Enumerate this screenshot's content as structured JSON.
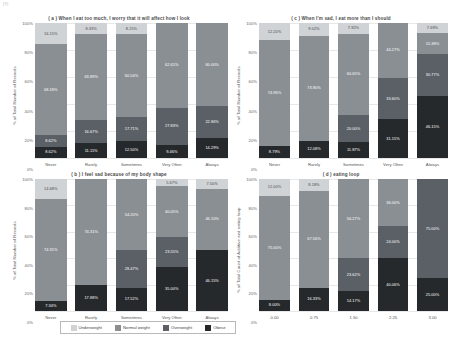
{
  "corner_mark": "[9]",
  "legend": {
    "items": [
      {
        "label": "Underweight",
        "color": "#cfd3d6"
      },
      {
        "label": "Normal weight",
        "color": "#8a8f94"
      },
      {
        "label": "Overweight",
        "color": "#5a6066"
      },
      {
        "label": "Obese",
        "color": "#26292c"
      }
    ]
  },
  "yticks": [
    "100%",
    "80%",
    "60%",
    "40%",
    "20%",
    "0%"
  ],
  "chart_data": [
    {
      "id": "a",
      "type": "bar",
      "stacked": true,
      "title": "( a ) When I eat too much, I worry that it will affect how I look",
      "xlabel": "",
      "ylabel": "% of Total Number of Records",
      "ylim": [
        0,
        100
      ],
      "grid": true,
      "legend_position": "bottom-center",
      "categories": [
        "Never",
        "Rarely",
        "Sometimes",
        "Very Often",
        "Always"
      ],
      "series": [
        {
          "name": "Underweight",
          "values": [
            16.15,
            8.33,
            8.25,
            0.0,
            0.0
          ],
          "labels": [
            "16.15%",
            "8.33%",
            "8.25%",
            "",
            ""
          ]
        },
        {
          "name": "Normal weight",
          "values": [
            68.18,
            63.89,
            60.54,
            62.61,
            60.0
          ],
          "labels": [
            "68.18%",
            "63.89%",
            "60.54%",
            "62.61%",
            "60.00%"
          ]
        },
        {
          "name": "Overweight",
          "values": [
            8.62,
            16.67,
            17.71,
            27.83,
            22.86
          ],
          "labels": [
            "8.62%",
            "16.67%",
            "17.71%",
            "27.83%",
            "22.86%"
          ]
        },
        {
          "name": "Obese",
          "values": [
            8.62,
            11.11,
            12.5,
            9.46,
            14.29
          ],
          "labels": [
            "8.62%",
            "11.11%",
            "12.50%",
            "9.46%",
            "14.29%"
          ]
        }
      ]
    },
    {
      "id": "c",
      "type": "bar",
      "stacked": true,
      "title": "( c ) When I'm sad, I eat more than I should",
      "xlabel": "",
      "ylabel": "% of Total Number of Records",
      "ylim": [
        0,
        100
      ],
      "grid": true,
      "categories": [
        "Never",
        "Rarely",
        "Sometimes",
        "Very Often",
        "Always"
      ],
      "series": [
        {
          "name": "Underweight",
          "values": [
            12.2,
            9.02,
            7.92,
            0.0,
            7.69
          ],
          "labels": [
            "12.20%",
            "9.02%",
            "7.92%",
            "",
            "7.69%"
          ]
        },
        {
          "name": "Normal weight",
          "values": [
            74.96,
            73.9,
            60.65,
            44.27,
            15.38
          ],
          "labels": [
            "74.96%",
            "73.90%",
            "60.65%",
            "44.27%",
            "15.38%"
          ]
        },
        {
          "name": "Overweight",
          "values": [
            0.0,
            0.0,
            20.0,
            33.6,
            30.77
          ],
          "labels": [
            "",
            "",
            "20.00%",
            "33.60%",
            "30.77%"
          ]
        },
        {
          "name": "Obese",
          "values": [
            8.79,
            12.08,
            11.87,
            31.15,
            46.15
          ],
          "labels": [
            "8.79%",
            "12.08%",
            "11.87%",
            "31.15%",
            "46.15%"
          ]
        }
      ]
    },
    {
      "id": "b",
      "type": "bar",
      "stacked": true,
      "title": "( b ) I feel sad because of my body shape",
      "xlabel": "",
      "ylabel": "% of Total Number of Records",
      "ylim": [
        0,
        100
      ],
      "grid": true,
      "categories": [
        "Never",
        "Rarely",
        "Sometimes",
        "Very Often",
        "Always"
      ],
      "series": [
        {
          "name": "Underweight",
          "values": [
            14.68,
            0.0,
            0.0,
            5.67,
            7.5
          ],
          "labels": [
            "14.68%",
            "",
            "",
            "5.67%",
            "7.50%"
          ]
        },
        {
          "name": "Normal weight",
          "values": [
            74.31,
            74.31,
            54.2,
            40.05,
            46.1
          ],
          "labels": [
            "74.31%",
            "74.31%",
            "54.20%",
            "40.05%",
            "46.10%"
          ]
        },
        {
          "name": "Overweight",
          "values": [
            0.0,
            0.0,
            28.47,
            23.55,
            0.0
          ],
          "labels": [
            "",
            "",
            "28.47%",
            "23.55%",
            ""
          ]
        },
        {
          "name": "Obese",
          "values": [
            7.34,
            17.88,
            17.52,
            35.0,
            46.15
          ],
          "labels": [
            "7.34%",
            "17.88%",
            "17.52%",
            "35.00%",
            "46.15%"
          ]
        }
      ]
    },
    {
      "id": "d",
      "type": "bar",
      "stacked": true,
      "title": "( d ) eating loop",
      "xlabel": "",
      "ylabel": "% of Total Count of Additive and eating loop",
      "ylim": [
        0,
        100
      ],
      "grid": true,
      "categories": [
        "0.00",
        "0.75",
        "1.50",
        "2.25",
        "3.00"
      ],
      "series": [
        {
          "name": "Underweight",
          "values": [
            12.0,
            8.18,
            0.0,
            0.0,
            0.0
          ],
          "labels": [
            "12.00%",
            "8.18%",
            "",
            "",
            ""
          ]
        },
        {
          "name": "Normal weight",
          "values": [
            75.0,
            67.56,
            56.27,
            36.0,
            0.0
          ],
          "labels": [
            "75.00%",
            "67.56%",
            "56.27%",
            "36.00%",
            ""
          ]
        },
        {
          "name": "Overweight",
          "values": [
            0.0,
            0.0,
            23.62,
            24.0,
            75.0
          ],
          "labels": [
            "",
            "",
            "23.62%",
            "24.00%",
            "75.00%"
          ]
        },
        {
          "name": "Obese",
          "values": [
            8.0,
            16.33,
            14.17,
            40.06,
            25.0
          ],
          "labels": [
            "8.00%",
            "16.33%",
            "14.17%",
            "40.06%",
            "25.00%"
          ]
        }
      ]
    }
  ]
}
